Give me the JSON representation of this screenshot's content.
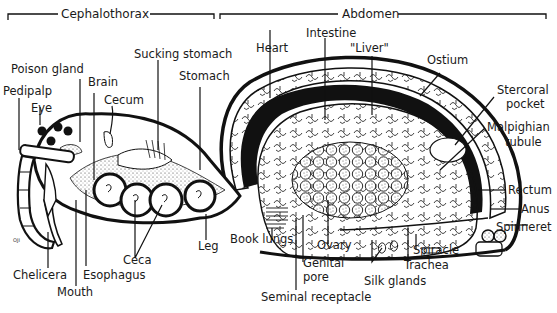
{
  "diagram": {
    "colors": {
      "ink": "#111111",
      "background": "#ffffff"
    },
    "regions": [
      {
        "id": "cephalothorax",
        "label": "Cephalothorax"
      },
      {
        "id": "abdomen",
        "label": "Abdomen"
      }
    ],
    "labels": {
      "pedipalp": "Pedipalp",
      "poison_gland": "Poison gland",
      "eye": "Eye",
      "brain": "Brain",
      "cecum": "Cecum",
      "sucking_stomach": "Sucking stomach",
      "stomach": "Stomach",
      "heart": "Heart",
      "intestine": "Intestine",
      "liver": "\"Liver\"",
      "ostium": "Ostium",
      "stercoral_pocket_1": "Stercoral",
      "stercoral_pocket_2": "pocket",
      "malpighian_tubule_1": "Malpighian",
      "malpighian_tubule_2": "tubule",
      "rectum": "Rectum",
      "anus": "Anus",
      "spinneret": "Spinneret",
      "chelicera": "Chelicera",
      "mouth": "Mouth",
      "esophagus": "Esophagus",
      "ceca": "Ceca",
      "leg": "Leg",
      "book_lungs": "Book lungs",
      "genital_pore_1": "Genital",
      "genital_pore_2": "pore",
      "seminal_receptacle": "Seminal receptacle",
      "ovary": "Ovary",
      "silk_glands": "Silk glands",
      "spiracle": "Spiracle",
      "trachea": "Trachea",
      "artist_mark": "OJI"
    }
  }
}
